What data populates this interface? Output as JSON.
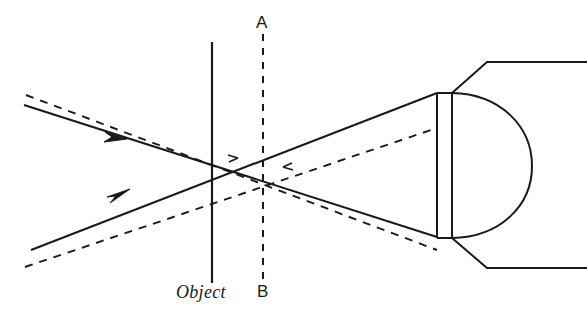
{
  "figure": {
    "kind": "optical-ray-diagram",
    "background_color": "#ffffff",
    "ink_color": "#1a1a1a",
    "width": 587,
    "height": 324
  },
  "labels": {
    "object": "Object",
    "axis_top": "A",
    "axis_bottom": "B"
  },
  "label_positions": {
    "object": {
      "x": 176,
      "y": 283
    },
    "axis_top": {
      "x": 256,
      "y": 14
    },
    "axis_bottom": {
      "x": 257,
      "y": 283
    }
  },
  "geometry": {
    "object_plane": {
      "name": "object-plane-line",
      "style": "solid",
      "x": 212,
      "y_top": 42,
      "y_bottom": 283,
      "stroke_width": 2.1
    },
    "ab_axis": {
      "name": "ab-reference-line",
      "style": "dashed",
      "x": 263,
      "y_top": 34,
      "y_bottom": 284,
      "stroke_width": 2.0,
      "dash_pattern": "7,7"
    },
    "solid_rays": [
      {
        "name": "solid-ray-upper",
        "x1": 24,
        "y1": 105,
        "x2": 437,
        "y2": 237
      },
      {
        "name": "solid-ray-lower",
        "x1": 31,
        "y1": 250,
        "x2": 437,
        "y2": 93
      }
    ],
    "dashed_rays": [
      {
        "name": "dashed-ray-upper",
        "x1": 26,
        "y1": 95,
        "x2": 437,
        "y2": 250
      },
      {
        "name": "dashed-ray-lower",
        "x1": 25,
        "y1": 267,
        "x2": 437,
        "y2": 128
      }
    ],
    "arrowheads": [
      {
        "name": "ray-direction-arrow-upper",
        "x": 118,
        "y": 135,
        "angle_deg": 19.0
      },
      {
        "name": "ray-direction-arrow-lower",
        "x": 120,
        "y": 194,
        "angle_deg": 19.0
      }
    ],
    "crossing_points": {
      "solid_focus": {
        "x": 212,
        "y": 167
      },
      "dashed_focus": {
        "x": 259,
        "y": 173
      }
    },
    "lens_slab": {
      "name": "lens-slab",
      "left_x": 437,
      "right_x": 452,
      "y_top": 93,
      "y_bottom": 238,
      "stroke_width": 2.0
    },
    "eye_dome": {
      "name": "eye-dome-arc",
      "cx": 452,
      "top": {
        "x": 452,
        "y": 93
      },
      "bottom": {
        "x": 452,
        "y": 238
      },
      "rightmost_x": 532,
      "stroke_width": 2.0
    },
    "mount_top": {
      "name": "mount-bracket-top",
      "corner_x": 452,
      "corner_y": 93,
      "elbow_x": 487,
      "elbow_y": 62,
      "end_x": 587,
      "end_y": 62
    },
    "mount_bottom": {
      "name": "mount-bracket-bottom",
      "corner_x": 452,
      "corner_y": 238,
      "elbow_x": 487,
      "elbow_y": 268,
      "end_x": 587,
      "end_y": 268
    }
  }
}
